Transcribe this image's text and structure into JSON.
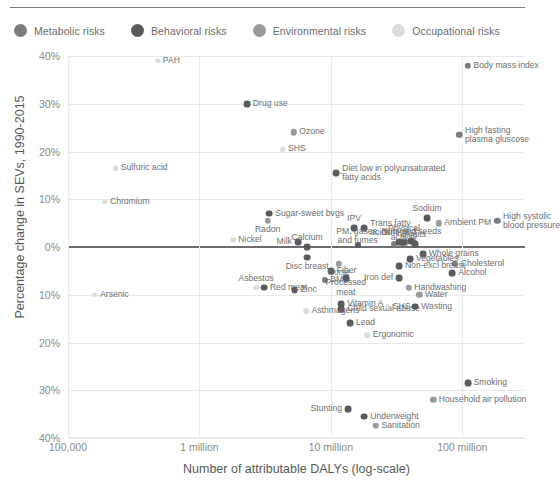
{
  "legend": {
    "items": [
      {
        "label": "Metabolic risks",
        "color": "#7b7c7e",
        "key": "metabolic"
      },
      {
        "label": "Behavioral risks",
        "color": "#5a5b5d",
        "key": "behavioral"
      },
      {
        "label": "Environmental risks",
        "color": "#989a9c",
        "key": "environmental"
      },
      {
        "label": "Occupational risks",
        "color": "#dcdcdd",
        "key": "occupational"
      }
    ]
  },
  "chart_data": {
    "type": "scatter",
    "title": "",
    "xlabel": "Number of attributable DALYs (log-scale)",
    "ylabel": "Percentage change in SEVs, 1990-2015",
    "xscale": "log",
    "xlim": [
      100000,
      300000000
    ],
    "ylim": [
      -40,
      40
    ],
    "xticks": [
      100000,
      1000000,
      10000000,
      100000000
    ],
    "xticklabels": [
      "100,000",
      "1 million",
      "10 million",
      "100 million"
    ],
    "yticks": [
      40,
      30,
      20,
      10,
      0,
      -10,
      -20,
      -30,
      -40
    ],
    "yticklabels": [
      "40%",
      "30%",
      "20%",
      "10%",
      "0%",
      "10%",
      "20%",
      "30%",
      "40%"
    ],
    "grid": true,
    "zero_line": 0,
    "legend_position": "top",
    "series": [
      {
        "name": "Metabolic risks",
        "color": "#7b7c7e",
        "points": [
          {
            "label": "Body mass index",
            "x": 110000000,
            "y": 38.0,
            "lx": "right",
            "r": 3.2
          },
          {
            "label": "High fasting\nplasma gluscose",
            "x": 95000000,
            "y": 23.5,
            "lx": "right",
            "r": 3.2
          },
          {
            "label": "High systolic\nblood pressure",
            "x": 185000000,
            "y": 5.5,
            "lx": "right",
            "r": 3.2
          },
          {
            "label": "Cholesterol",
            "x": 88000000,
            "y": -3.5,
            "lx": "right",
            "r": 3.2
          },
          {
            "label": "BMD",
            "x": 9000000,
            "y": -7.0,
            "lx": "right",
            "r": 3.0
          },
          {
            "label": "GFR",
            "x": 30000000,
            "y": 0.6,
            "lx": "right",
            "r": 3.0
          }
        ]
      },
      {
        "name": "Behavioral risks",
        "color": "#5a5b5d",
        "points": [
          {
            "label": "Drug use",
            "x": 2300000,
            "y": 30.0,
            "lx": "right",
            "r": 3.4
          },
          {
            "label": "Diet low in polyunsaturated\nfatty acids",
            "x": 11000000,
            "y": 15.5,
            "lx": "right",
            "r": 3.4,
            "leader": true
          },
          {
            "label": "Sugar-sweet bvgs",
            "x": 3400000,
            "y": 7.0,
            "lx": "right",
            "r": 3.4
          },
          {
            "label": "Milk",
            "x": 5600000,
            "y": 1.0,
            "lx": "left",
            "r": 3.4
          },
          {
            "label": "Calcium",
            "x": 6600000,
            "y": 0.0,
            "lx": "center-above",
            "r": 3.4
          },
          {
            "label": "Disc breast",
            "x": 6600000,
            "y": -2.2,
            "lx": "center-below",
            "r": 3.4
          },
          {
            "label": "Trans fatty\nacids",
            "x": 18000000,
            "y": 4.0,
            "lx": "right",
            "r": 3.4
          },
          {
            "label": "IPV",
            "x": 15000000,
            "y": 4.0,
            "lx": "center-above",
            "r": 3.4
          },
          {
            "label": "Omega 3",
            "x": 33000000,
            "y": 1.0,
            "lx": "center-above",
            "r": 3.4
          },
          {
            "label": "Physical\nactivity",
            "x": 36000000,
            "y": 1.0,
            "lx": "center-above",
            "r": 3.4,
            "leader": true
          },
          {
            "label": "Nuts and seeds",
            "x": 41000000,
            "y": 1.2,
            "lx": "center-above",
            "r": 3.4
          },
          {
            "label": "Fruits",
            "x": 44000000,
            "y": 0.6,
            "lx": "center-above",
            "r": 3.4
          },
          {
            "label": "Sodium",
            "x": 54000000,
            "y": 6.0,
            "lx": "center-above",
            "r": 3.4
          },
          {
            "label": "Whole grains",
            "x": 50000000,
            "y": -1.5,
            "lx": "right",
            "r": 3.4
          },
          {
            "label": "Vegetables",
            "x": 40000000,
            "y": -2.5,
            "lx": "right",
            "r": 3.4
          },
          {
            "label": "Non-excl breast",
            "x": 33000000,
            "y": -4.0,
            "lx": "right",
            "r": 3.4
          },
          {
            "label": "Iron def",
            "x": 33000000,
            "y": -6.5,
            "lx": "left",
            "r": 3.4
          },
          {
            "label": "Alcohol",
            "x": 84000000,
            "y": -5.5,
            "lx": "right",
            "r": 3.4
          },
          {
            "label": "Processed\nmeat",
            "x": 13000000,
            "y": -6.5,
            "lx": "center-below",
            "r": 3.4
          },
          {
            "label": "Fiber",
            "x": 10000000,
            "y": -5.0,
            "lx": "right",
            "r": 3.4
          },
          {
            "label": "Red meat",
            "x": 3100000,
            "y": -8.5,
            "lx": "right",
            "r": 3.4
          },
          {
            "label": "Zinc",
            "x": 5300000,
            "y": -9.0,
            "lx": "right",
            "r": 3.4
          },
          {
            "label": "Vitamin A",
            "x": 12000000,
            "y": -12.0,
            "lx": "right",
            "r": 3.4
          },
          {
            "label": "Child sexual abuse",
            "x": 12000000,
            "y": -13.0,
            "lx": "right",
            "r": 3.4
          },
          {
            "label": "Lead",
            "x": 14000000,
            "y": -16.0,
            "lx": "right",
            "r": 3.4
          },
          {
            "label": "Smoking",
            "x": 110000000,
            "y": -28.5,
            "lx": "right",
            "r": 3.4
          },
          {
            "label": "Stunting",
            "x": 13500000,
            "y": -34.0,
            "lx": "left",
            "r": 3.4
          },
          {
            "label": "Underweight",
            "x": 18000000,
            "y": -35.5,
            "lx": "right",
            "r": 3.4
          },
          {
            "label": "Wasting",
            "x": 44000000,
            "y": -12.5,
            "lx": "right",
            "r": 3.4
          },
          {
            "label": "PM, gases,\nand fumes",
            "x": 16000000,
            "y": 0.4,
            "lx": "center-above",
            "r": 3.0
          }
        ]
      },
      {
        "name": "Environmental risks",
        "color": "#989a9c",
        "points": [
          {
            "label": "Ozone",
            "x": 5200000,
            "y": 24.0,
            "lx": "right",
            "r": 3.2
          },
          {
            "label": "Radon",
            "x": 3300000,
            "y": 5.5,
            "lx": "center-below",
            "r": 3.2
          },
          {
            "label": "Ambient PM",
            "x": 66000000,
            "y": 5.0,
            "lx": "right",
            "r": 3.2
          },
          {
            "label": "Handwashing",
            "x": 39000000,
            "y": -8.5,
            "lx": "right",
            "r": 3.2
          },
          {
            "label": "Water",
            "x": 47000000,
            "y": -10.0,
            "lx": "right",
            "r": 3.2
          },
          {
            "label": "Household air pollution",
            "x": 60000000,
            "y": -32.0,
            "lx": "right",
            "r": 3.2
          },
          {
            "label": "Sanitation",
            "x": 22000000,
            "y": -37.5,
            "lx": "right",
            "r": 3.2
          },
          {
            "label": "Noise",
            "x": 11500000,
            "y": -3.5,
            "lx": "center-below",
            "r": 3.2
          }
        ]
      },
      {
        "name": "Occupational risks",
        "color": "#dcdcdd",
        "points": [
          {
            "label": "PAH",
            "x": 480000,
            "y": 39.0,
            "lx": "right",
            "r": 2.8
          },
          {
            "label": "Sulfuric acid",
            "x": 230000,
            "y": 16.5,
            "lx": "right",
            "r": 2.8
          },
          {
            "label": "Chromium",
            "x": 190000,
            "y": 9.5,
            "lx": "right",
            "r": 2.8
          },
          {
            "label": "SHS",
            "x": 4300000,
            "y": 20.5,
            "lx": "right",
            "r": 2.8
          },
          {
            "label": "Nickel",
            "x": 1800000,
            "y": 1.5,
            "lx": "right",
            "r": 2.8
          },
          {
            "label": "Arsenic",
            "x": 160000,
            "y": -10.0,
            "lx": "right",
            "r": 2.8
          },
          {
            "label": "Asbestos",
            "x": 2700000,
            "y": -8.5,
            "lx": "center-above",
            "r": 2.8
          },
          {
            "label": "Asthmagens",
            "x": 6500000,
            "y": -13.5,
            "lx": "right",
            "r": 2.8
          },
          {
            "label": "SHS",
            "x": 27000000,
            "y": -12.5,
            "lx": "right",
            "r": 2.8
          },
          {
            "label": "Ergonomic",
            "x": 19000000,
            "y": -18.5,
            "lx": "right",
            "r": 2.8
          }
        ]
      }
    ]
  }
}
